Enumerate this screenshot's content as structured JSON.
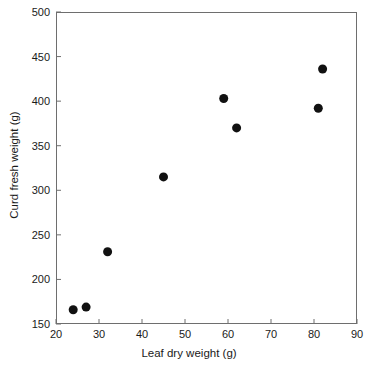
{
  "chart_data": {
    "type": "scatter",
    "title": "",
    "xlabel": "Leaf dry weight (g)",
    "ylabel": "Curd fresh weight (g)",
    "xlim": [
      20,
      90
    ],
    "ylim": [
      150,
      500
    ],
    "xticks": [
      20,
      30,
      40,
      50,
      60,
      70,
      80,
      90
    ],
    "yticks": [
      150,
      200,
      250,
      300,
      350,
      400,
      450,
      500
    ],
    "xtick_labels": [
      "20",
      "30",
      "40",
      "50",
      "60",
      "70",
      "80",
      "90"
    ],
    "ytick_labels": [
      "150",
      "200",
      "250",
      "300",
      "350",
      "400",
      "450",
      "500"
    ],
    "grid": false,
    "legend": null,
    "marker": {
      "shape": "circle",
      "color": "#111111",
      "size_px": 9
    },
    "series": [
      {
        "name": "Cauliflower plants",
        "x": [
          24,
          27,
          32,
          45,
          59,
          62,
          81,
          82
        ],
        "y": [
          166,
          169,
          231,
          315,
          403,
          370,
          392,
          436
        ]
      }
    ],
    "points": [
      {
        "x": 24,
        "y": 166
      },
      {
        "x": 27,
        "y": 169
      },
      {
        "x": 32,
        "y": 231
      },
      {
        "x": 45,
        "y": 315
      },
      {
        "x": 59,
        "y": 403
      },
      {
        "x": 62,
        "y": 370
      },
      {
        "x": 81,
        "y": 392
      },
      {
        "x": 82,
        "y": 436
      }
    ],
    "colors": {
      "axis": "#6e6e6e",
      "text": "#1a1a1a",
      "marker": "#111111",
      "background": "#ffffff"
    }
  }
}
